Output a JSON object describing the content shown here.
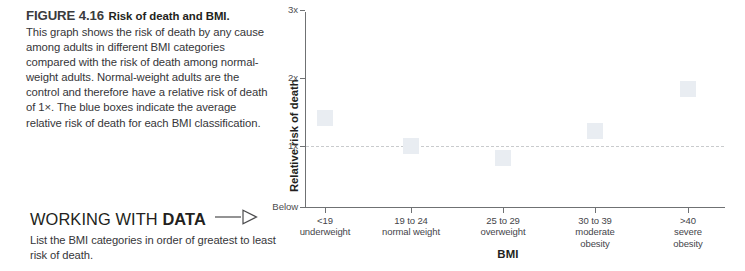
{
  "figure": {
    "number": "FIGURE 4.16",
    "title": "Risk of death and BMI.",
    "caption": "This graph shows the risk of death by any cause among adults in different BMI categories compared with the risk of death among normal-weight adults. Normal-weight adults are the control and therefore have a relative risk of death of 1×. The blue boxes indicate the average relative risk of death for each BMI classification."
  },
  "working_with_data": {
    "title_normal": "WORKING WITH ",
    "title_bold": "DATA",
    "prompt": "List the BMI categories in order of greatest to least risk of death.",
    "arrow_icon": "arrow-right-outline-icon"
  },
  "chart_data": {
    "type": "scatter",
    "title": "Risk of death and BMI",
    "xlabel": "BMI",
    "ylabel": "Relative risk of death",
    "categories": [
      "<19\nunderweight",
      "19 to 24\nnormal weight",
      "25 to 29\noverweight",
      "30 to 39\nmoderate\nobesity",
      ">40\nsevere\nobesity"
    ],
    "category_lines": [
      [
        "<19",
        "underweight"
      ],
      [
        "19 to 24",
        "normal weight"
      ],
      [
        "25 to 29",
        "overweight"
      ],
      [
        "30 to 39",
        "moderate",
        "obesity"
      ],
      [
        ">40",
        "severe",
        "obesity"
      ]
    ],
    "values": [
      1.41,
      1.0,
      0.82,
      1.22,
      1.84
    ],
    "ytick_labels": [
      "3x",
      "2x",
      "1x",
      "Below"
    ],
    "ytick_values": [
      3,
      2,
      1,
      0
    ],
    "ylim": [
      0,
      3
    ],
    "reference_line": {
      "value": 1,
      "style": "dashed",
      "color": "#c9cbcd"
    },
    "marker_color": "#e9edf2",
    "grid": false,
    "legend": "none"
  },
  "colors": {
    "axis": "#6f7173",
    "text": "#231f20",
    "body_text": "#363639",
    "marker": "#e9edf2"
  }
}
